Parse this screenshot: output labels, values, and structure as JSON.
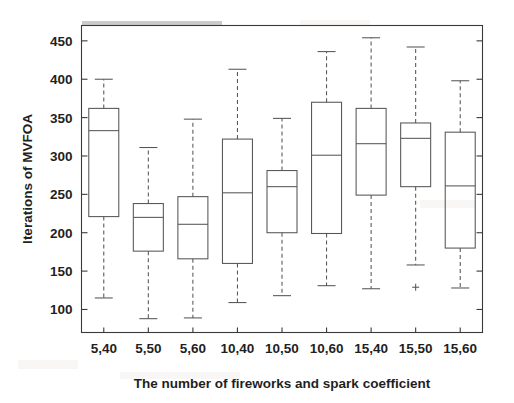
{
  "chart_data": {
    "type": "box",
    "title": "",
    "xlabel": "The number of fireworks and spark  coefficient",
    "ylabel": "Iterations of MVFOA",
    "ylim": [
      70,
      470
    ],
    "yticks": [
      100,
      150,
      200,
      250,
      300,
      350,
      400,
      450
    ],
    "ytick_labels": [
      "100",
      "150",
      "200",
      "250",
      "300",
      "350",
      "400",
      "450"
    ],
    "grid": false,
    "legend": "none",
    "categories": [
      "5,40",
      "5,50",
      "5,60",
      "10,40",
      "10,50",
      "10,60",
      "15,40",
      "15,50",
      "15,60"
    ],
    "boxes": [
      {
        "category": "5,40",
        "whisker_low": 115,
        "q1": 221,
        "median": 333,
        "q3": 362,
        "whisker_high": 400,
        "outliers": []
      },
      {
        "category": "5,50",
        "whisker_low": 88,
        "q1": 176,
        "median": 220,
        "q3": 238,
        "whisker_high": 311,
        "outliers": []
      },
      {
        "category": "5,60",
        "whisker_low": 89,
        "q1": 166,
        "median": 211,
        "q3": 247,
        "whisker_high": 348,
        "outliers": []
      },
      {
        "category": "10,40",
        "whisker_low": 109,
        "q1": 160,
        "median": 252,
        "q3": 322,
        "whisker_high": 413,
        "outliers": []
      },
      {
        "category": "10,50",
        "whisker_low": 118,
        "q1": 200,
        "median": 260,
        "q3": 281,
        "whisker_high": 349,
        "outliers": []
      },
      {
        "category": "10,60",
        "whisker_low": 131,
        "q1": 199,
        "median": 301,
        "q3": 370,
        "whisker_high": 436,
        "outliers": []
      },
      {
        "category": "15,40",
        "whisker_low": 127,
        "q1": 249,
        "median": 316,
        "q3": 362,
        "whisker_high": 454,
        "outliers": []
      },
      {
        "category": "15,50",
        "whisker_low": 158,
        "q1": 260,
        "median": 323,
        "q3": 343,
        "whisker_high": 442,
        "outliers": [
          129
        ]
      },
      {
        "category": "15,60",
        "whisker_low": 128,
        "q1": 180,
        "median": 261,
        "q3": 331,
        "whisker_high": 398,
        "outliers": []
      }
    ]
  },
  "axes": {
    "y_axis_title": "Iterations of MVFOA",
    "x_axis_title": "The number of fireworks and spark  coefficient"
  },
  "colors": {
    "line": "#555555",
    "axis": "#3a3a3a",
    "text": "#1f1f1f",
    "background": "#ffffff"
  }
}
